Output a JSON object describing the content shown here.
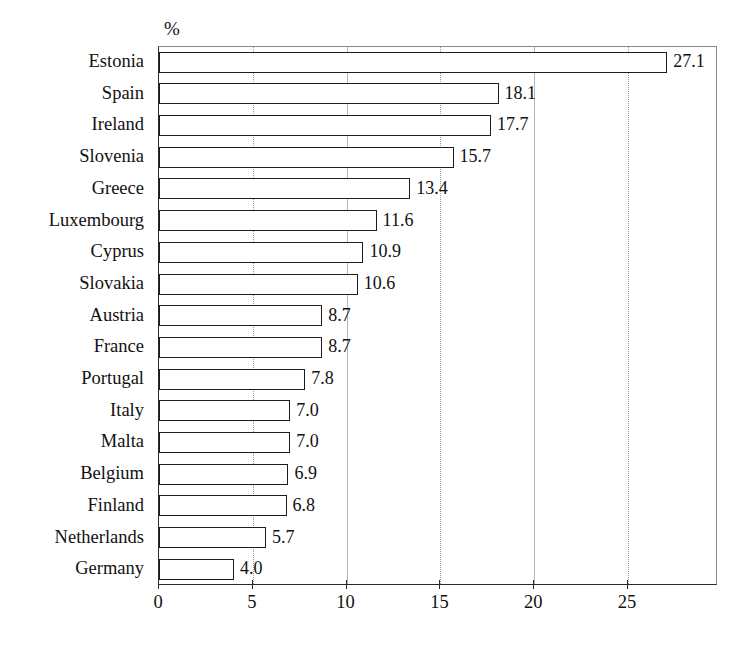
{
  "chart_data": {
    "type": "bar",
    "orientation": "horizontal",
    "title": "",
    "subtitle": "",
    "unit_label": "%",
    "xlabel": "",
    "ylabel": "",
    "xlim": [
      0,
      29.8
    ],
    "xticks": [
      0,
      5,
      10,
      15,
      20,
      25
    ],
    "xtick_labels": [
      "0",
      "5",
      "10",
      "15",
      "20",
      "25"
    ],
    "grid": true,
    "grid_axis": "x",
    "legend": false,
    "legend_position": "none",
    "bar_fill": "#ffffff",
    "bar_edge": "#1d1d1d",
    "categories": [
      "Estonia",
      "Spain",
      "Ireland",
      "Slovenia",
      "Greece",
      "Luxembourg",
      "Cyprus",
      "Slovakia",
      "Austria",
      "France",
      "Portugal",
      "Italy",
      "Malta",
      "Belgium",
      "Finland",
      "Netherlands",
      "Germany"
    ],
    "values": [
      27.1,
      18.1,
      17.7,
      15.7,
      13.4,
      11.6,
      10.9,
      10.6,
      8.7,
      8.7,
      7.8,
      7.0,
      7.0,
      6.9,
      6.8,
      5.7,
      4.0
    ],
    "data_labels": [
      "27.1",
      "18.1",
      "17.7",
      "15.7",
      "13.4",
      "11.6",
      "10.9",
      "10.6",
      "8.7",
      "8.7",
      "7.8",
      "7.0",
      "7.0",
      "6.9",
      "6.8",
      "5.7",
      "4.0"
    ]
  }
}
